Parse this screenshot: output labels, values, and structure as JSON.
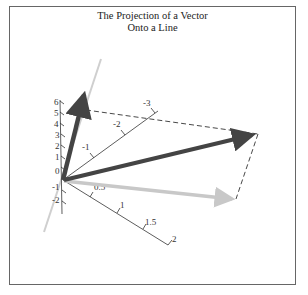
{
  "figure": {
    "title_line1": "The Projection of a Vector",
    "title_line2": "Onto a Line"
  },
  "axes": {
    "vertical_ticks": [
      "6",
      "5",
      "4",
      "3",
      "2",
      "1",
      "0",
      "-1",
      "-2"
    ],
    "diagonal_ticks": [
      "-1",
      "-2",
      "-3"
    ],
    "lower_ticks": [
      "0.5",
      "1",
      "1.5",
      "2"
    ]
  },
  "elements": {
    "vector_v": "vector v (long dark arrow)",
    "vector_line_dir": "line direction vector (short dark arrow)",
    "line": "line through origin (light gray)",
    "projection": "projection of v onto line (light gray arrow)",
    "dashed_box": "dashed construction lines"
  },
  "colors": {
    "dark_vector": "#444444",
    "light_projection": "#c8c8c8",
    "line_gray": "#cfcfcf",
    "axis": "#333333",
    "frame": "#666666"
  }
}
